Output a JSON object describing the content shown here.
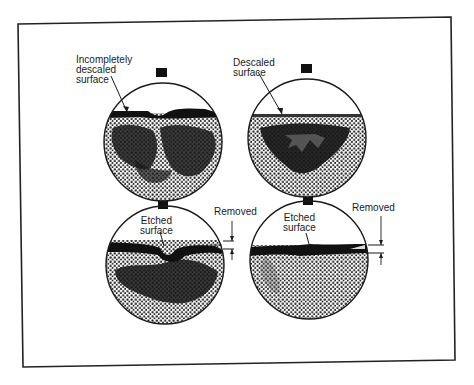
{
  "figure": {
    "colors": {
      "background": "#ffffff",
      "ink": "#1a1a1a",
      "stipple": "#2a2a2a",
      "scale": "#111111"
    },
    "panels": [
      {
        "id": "incompletely-descaled",
        "label": "Incompletely\ndescaled\nsurface"
      },
      {
        "id": "descaled",
        "label": "Descaled\nsurface"
      },
      {
        "id": "etched-with-scale",
        "label": "Etched\nsurface",
        "dimension_label": "Removed"
      },
      {
        "id": "etched-clean",
        "label": "Etched\nsurface",
        "dimension_label": "Removed"
      }
    ]
  }
}
